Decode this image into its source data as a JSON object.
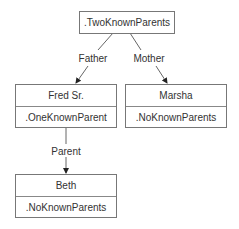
{
  "diagram": {
    "root": {
      "label": ".TwoKnownParents"
    },
    "nodes": [
      {
        "id": "fred",
        "name": "Fred Sr.",
        "type": ".OneKnownParent"
      },
      {
        "id": "marsha",
        "name": "Marsha",
        "type": ".NoKnownParents"
      },
      {
        "id": "beth",
        "name": "Beth",
        "type": ".NoKnownParents"
      }
    ],
    "edges": [
      {
        "from": "root",
        "to": "fred",
        "label": "Father"
      },
      {
        "from": "root",
        "to": "marsha",
        "label": "Mother"
      },
      {
        "from": "fred",
        "to": "beth",
        "label": "Parent"
      }
    ]
  }
}
